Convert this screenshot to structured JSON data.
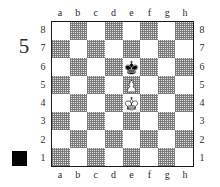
{
  "diagram": {
    "number": "5",
    "side_to_move_marker": "black-square",
    "side_to_move": "black",
    "marker_color": "#050505"
  },
  "board": {
    "light_square_color": "#ffffff",
    "dark_square_color": "#c8c8c8",
    "border_color": "#1a1a1a",
    "files": [
      "a",
      "b",
      "c",
      "d",
      "e",
      "f",
      "g",
      "h"
    ],
    "ranks": [
      "8",
      "7",
      "6",
      "5",
      "4",
      "3",
      "2",
      "1"
    ],
    "file_labels_top": [
      "a",
      "b",
      "c",
      "d",
      "e",
      "f",
      "g",
      "h"
    ],
    "file_labels_bottom": [
      "a",
      "b",
      "c",
      "d",
      "e",
      "f",
      "g",
      "h"
    ],
    "rank_labels_left": [
      "8",
      "7",
      "6",
      "5",
      "4",
      "3",
      "2",
      "1"
    ],
    "rank_labels_right": [
      "8",
      "7",
      "6",
      "5",
      "4",
      "3",
      "2",
      "1"
    ]
  },
  "pieces": [
    {
      "square": "e6",
      "file": "e",
      "rank": "6",
      "color": "black",
      "type": "king",
      "glyph": "black-king-icon"
    },
    {
      "square": "e5",
      "file": "e",
      "rank": "5",
      "color": "white",
      "type": "pawn",
      "glyph": "white-pawn-icon"
    },
    {
      "square": "e4",
      "file": "e",
      "rank": "4",
      "color": "white",
      "type": "king",
      "glyph": "white-king-icon"
    }
  ],
  "position": {
    "fen_pieces": "8/8/4k3/4P3/4K3/8/8/8",
    "description": "Black king e6, White pawn e5, White king e4"
  }
}
